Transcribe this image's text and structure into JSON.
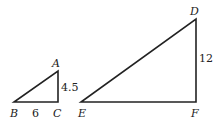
{
  "diagram": {
    "type": "similar-right-triangles",
    "small_triangle": {
      "vertices": {
        "A": "A",
        "B": "B",
        "C": "C"
      },
      "side_BC": "6",
      "side_AC": "4.5",
      "right_angle_at": "C"
    },
    "large_triangle": {
      "vertices": {
        "D": "D",
        "E": "E",
        "F": "F"
      },
      "side_DF": "12",
      "right_angle_at": "F"
    },
    "colors": {
      "stroke": "#222222",
      "background": "#ffffff"
    }
  }
}
